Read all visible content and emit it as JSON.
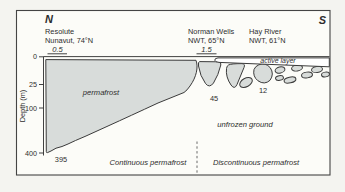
{
  "diagram": {
    "north_label": "N",
    "south_label": "S",
    "stations": {
      "resolute": {
        "name": "Resolute",
        "region": "Nunavut, 74°N",
        "active_layer_m": "0.5",
        "permafrost_depth_m": "395"
      },
      "norman_wells": {
        "name": "Norman Wells",
        "region": "NWT, 65°N",
        "active_layer_m": "1.5",
        "permafrost_depth_m": "45"
      },
      "hay_river": {
        "name": "Hay River",
        "region": "NWT, 61°N",
        "permafrost_depth_m": "12"
      }
    },
    "axis": {
      "label": "Depth (m)",
      "ticks": [
        "0",
        "25",
        "100",
        "400"
      ]
    },
    "zone_labels": {
      "permafrost": "permafrost",
      "active_layer": "active layer",
      "unfrozen_ground": "unfrozen ground",
      "continuous": "Continuous permafrost",
      "discontinuous": "Discontinuous permafrost"
    },
    "colors": {
      "permafrost_fill": "#d8dcda",
      "line": "#3b3b3b",
      "figure_background": "#fcfcf8"
    }
  }
}
